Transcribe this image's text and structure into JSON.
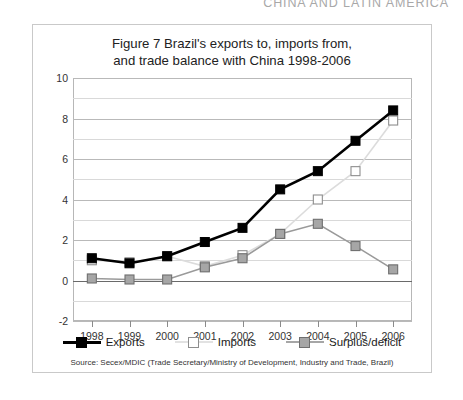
{
  "running_head": "CHINA AND LATIN AMERICA",
  "figure": {
    "title_line1": "Figure 7 Brazil's exports to, imports from,",
    "title_line2": "and trade balance with China 1998-2006",
    "source": "Source: Secex/MDIC (Trade Secretary/Ministry of Development, Industry and Trade, Brazil)"
  },
  "legend": {
    "items": [
      {
        "label": "Exports",
        "color": "#000000",
        "marker": "filled-square"
      },
      {
        "label": "Imports",
        "color": "#d6d6d6",
        "marker": "open-square"
      },
      {
        "label": "Surplus/deficit",
        "color": "#9a9a9a",
        "marker": "gray-square"
      }
    ]
  },
  "chart_data": {
    "type": "line",
    "title": "Figure 7 Brazil's exports to, imports from, and trade balance with China 1998-2006",
    "xlabel": "",
    "ylabel": "",
    "categories": [
      "1998",
      "1999",
      "2000",
      "2001",
      "2002",
      "2003",
      "2004",
      "2005",
      "2006"
    ],
    "x": [
      1998,
      1999,
      2000,
      2001,
      2002,
      2003,
      2004,
      2005,
      2006
    ],
    "ylim": [
      -2,
      10
    ],
    "yticks": [
      -2,
      0,
      2,
      4,
      6,
      8,
      10
    ],
    "ytick_labels": [
      "-2",
      "0",
      "2",
      "4",
      "6",
      "8",
      "10"
    ],
    "minor_gridline_step": 1,
    "grid": true,
    "legend_position": "bottom",
    "series": [
      {
        "name": "Exports",
        "color": "#000000",
        "marker": "filled-square",
        "values": [
          1.1,
          0.85,
          1.2,
          1.9,
          2.6,
          4.5,
          5.4,
          6.9,
          8.4
        ]
      },
      {
        "name": "Imports",
        "color": "#dcdcdc",
        "marker": "open-square",
        "values": [
          1.0,
          0.9,
          1.2,
          0.7,
          1.25,
          2.3,
          4.0,
          5.4,
          7.9
        ]
      },
      {
        "name": "Surplus/deficit",
        "color": "#9a9a9a",
        "marker": "gray-square",
        "values": [
          0.1,
          0.05,
          0.05,
          0.65,
          1.1,
          2.3,
          2.8,
          1.7,
          0.55
        ]
      }
    ]
  }
}
